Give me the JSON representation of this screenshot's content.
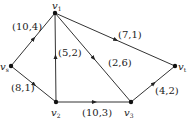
{
  "diagram": {
    "type": "directed-network-flow-graph",
    "colors": {
      "edge": "#333333",
      "node": "#111111",
      "background": "#ffffff"
    },
    "nodes": [
      {
        "id": "v1",
        "label": "v",
        "sub": "1",
        "x": 55,
        "y": 13,
        "lx": 52,
        "ly": 9
      },
      {
        "id": "vs",
        "label": "v",
        "sub": "s",
        "x": 11,
        "y": 66,
        "lx": 0,
        "ly": 70
      },
      {
        "id": "vt",
        "label": "v",
        "sub": "t",
        "x": 175,
        "y": 66,
        "lx": 178,
        "ly": 70
      },
      {
        "id": "v2",
        "label": "v",
        "sub": "2",
        "x": 56,
        "y": 102,
        "lx": 51,
        "ly": 116
      },
      {
        "id": "v3",
        "label": "v",
        "sub": "3",
        "x": 131,
        "y": 102,
        "lx": 124,
        "ly": 116
      }
    ],
    "edges": [
      {
        "from": "vs",
        "to": "v1",
        "label": "(10,4)",
        "lx": 12,
        "ly": 30
      },
      {
        "from": "vs",
        "to": "v2",
        "label": "(8,1)",
        "lx": 11,
        "ly": 91
      },
      {
        "from": "v2",
        "to": "v1",
        "label": "(5,2)",
        "lx": 58,
        "ly": 56
      },
      {
        "from": "v1",
        "to": "v3",
        "label": "(2,6)",
        "lx": 108,
        "ly": 66
      },
      {
        "from": "v1",
        "to": "vt",
        "label": "(7,1)",
        "lx": 118,
        "ly": 38
      },
      {
        "from": "v2",
        "to": "v3",
        "label": "(10,3)",
        "lx": 82,
        "ly": 116
      },
      {
        "from": "v3",
        "to": "vt",
        "label": "(4,2)",
        "lx": 155,
        "ly": 94
      }
    ]
  }
}
